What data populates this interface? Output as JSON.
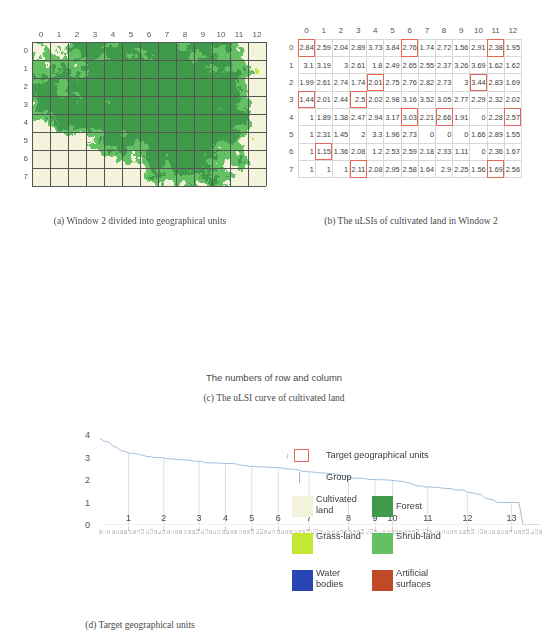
{
  "figure": {
    "panels": {
      "a": {
        "caption": "(a) Window 2 divided into geographical units"
      },
      "b": {
        "caption": "(b) The uLSIs of cultivated land in Window 2"
      },
      "c": {
        "caption": "(c) The uLSI curve of cultivated land"
      },
      "d": {
        "caption": "(d) Target geographical units"
      }
    }
  },
  "map": {
    "col_labels": [
      "0",
      "1",
      "2",
      "3",
      "4",
      "5",
      "6",
      "7",
      "8",
      "9",
      "10",
      "11",
      "12"
    ],
    "row_labels": [
      "0",
      "1",
      "2",
      "3",
      "4",
      "5",
      "6",
      "7"
    ]
  },
  "table": {
    "col_headers": [
      "0",
      "1",
      "2",
      "3",
      "4",
      "5",
      "6",
      "7",
      "8",
      "9",
      "10",
      "11",
      "12"
    ],
    "row_headers": [
      "0",
      "1",
      "2",
      "3",
      "4",
      "5",
      "6",
      "7"
    ],
    "rows": [
      [
        "2.84",
        "2.59",
        "2.04",
        "2.89",
        "3.73",
        "3.84",
        "2.76",
        "1.74",
        "2.72",
        "1.56",
        "2.91",
        "2.38",
        "1.95"
      ],
      [
        "3.1",
        "3.19",
        "3",
        "2.61",
        "1.8",
        "2.49",
        "2.65",
        "2.55",
        "2.37",
        "3.26",
        "3.69",
        "1.62",
        "1.62"
      ],
      [
        "1.99",
        "2.61",
        "2.74",
        "1.74",
        "2.01",
        "2.75",
        "2.76",
        "2.82",
        "2.73",
        "3",
        "3.44",
        "2.83",
        "1.69"
      ],
      [
        "1.44",
        "2.01",
        "2.44",
        "2.5",
        "2.02",
        "2.98",
        "3.16",
        "3.52",
        "3.05",
        "2.77",
        "2.29",
        "2.32",
        "2.02"
      ],
      [
        "1",
        "1.89",
        "1.38",
        "2.47",
        "2.94",
        "3.17",
        "3.03",
        "2.21",
        "2.66",
        "1.91",
        "0",
        "2.28",
        "2.57"
      ],
      [
        "1",
        "2.31",
        "1.45",
        "2",
        "3.3",
        "1.96",
        "2.73",
        "0",
        "0",
        "0",
        "1.66",
        "2.89",
        "1.55"
      ],
      [
        "1",
        "1.15",
        "1.36",
        "2.08",
        "1.2",
        "2.53",
        "2.59",
        "2.18",
        "2.33",
        "1.11",
        "0",
        "2.36",
        "1.67"
      ],
      [
        "1",
        "1",
        "1",
        "2.11",
        "2.08",
        "2.95",
        "2.58",
        "1.64",
        "2.9",
        "2.25",
        "1.56",
        "1.69",
        "2.56"
      ]
    ],
    "marked_cells": [
      [
        0,
        0
      ],
      [
        0,
        6
      ],
      [
        0,
        11
      ],
      [
        2,
        4
      ],
      [
        2,
        10
      ],
      [
        3,
        0
      ],
      [
        3,
        3
      ],
      [
        4,
        6
      ],
      [
        4,
        8
      ],
      [
        4,
        12
      ],
      [
        6,
        1
      ],
      [
        7,
        3
      ],
      [
        7,
        11
      ]
    ]
  },
  "chart_data": {
    "type": "line",
    "title": "",
    "xlabel": "The numbers of row and column",
    "ylabel": "uLSI",
    "ylim": [
      0,
      4
    ],
    "yticks": [
      0,
      1,
      2,
      3,
      4
    ],
    "grid": false,
    "legend": "none",
    "group_labels": [
      "1",
      "2",
      "3",
      "4",
      "5",
      "6",
      "7",
      "8",
      "9",
      "10",
      "11",
      "12",
      "13"
    ],
    "group_boundary_x": [
      0.065,
      0.145,
      0.225,
      0.285,
      0.345,
      0.405,
      0.475,
      0.565,
      0.625,
      0.665,
      0.745,
      0.835,
      0.935
    ],
    "series": [
      {
        "name": "uLSI sorted descending",
        "values": [
          3.84,
          3.73,
          3.69,
          3.52,
          3.44,
          3.3,
          3.26,
          3.19,
          3.17,
          3.16,
          3.1,
          3.05,
          3.03,
          3,
          3,
          2.98,
          2.95,
          2.94,
          2.91,
          2.9,
          2.89,
          2.89,
          2.84,
          2.83,
          2.82,
          2.77,
          2.76,
          2.76,
          2.75,
          2.74,
          2.73,
          2.73,
          2.72,
          2.66,
          2.65,
          2.61,
          2.61,
          2.59,
          2.59,
          2.58,
          2.57,
          2.56,
          2.55,
          2.53,
          2.5,
          2.49,
          2.47,
          2.44,
          2.38,
          2.37,
          2.36,
          2.33,
          2.32,
          2.31,
          2.29,
          2.28,
          2.25,
          2.21,
          2.18,
          2.11,
          2.08,
          2.08,
          2.08,
          2.04,
          2.02,
          2.02,
          2.01,
          2.01,
          2,
          1.99,
          1.96,
          1.95,
          1.91,
          1.89,
          1.8,
          1.74,
          1.74,
          1.69,
          1.69,
          1.67,
          1.66,
          1.64,
          1.62,
          1.62,
          1.56,
          1.56,
          1.55,
          1.45,
          1.44,
          1.38,
          1.36,
          1.2,
          1.15,
          1.11,
          1,
          1,
          1,
          1,
          1,
          1,
          0,
          0,
          0,
          0,
          0
        ]
      }
    ],
    "x_tick_labels_note": "row-column index pairs, rendered as micro-text"
  },
  "target_units": {
    "labels": [
      {
        "n": "9",
        "col": 0,
        "row": 0
      },
      {
        "n": "4",
        "col": 6,
        "row": 0
      },
      {
        "n": "7",
        "col": 11,
        "row": 0
      },
      {
        "n": "3",
        "col": 4,
        "row": 2
      },
      {
        "n": "1",
        "col": 10,
        "row": 2
      },
      {
        "n": "2",
        "col": 0,
        "row": 3
      },
      {
        "n": "10",
        "col": 3,
        "row": 3
      },
      {
        "n": "5",
        "col": 6,
        "row": 4
      },
      {
        "n": "12",
        "col": 8,
        "row": 4
      },
      {
        "n": "6",
        "col": 12,
        "row": 4
      },
      {
        "n": "13",
        "col": 1,
        "row": 6
      },
      {
        "n": "8",
        "col": 3,
        "row": 7
      },
      {
        "n": "11",
        "col": 11,
        "row": 7
      }
    ]
  },
  "legend": {
    "target_units": "Target geographical units",
    "group": "Group",
    "classes": [
      {
        "name": "Cultivated land",
        "color": "#f4f4dc"
      },
      {
        "name": "Forest",
        "color": "#3f9a4b"
      },
      {
        "name": "Grass-land",
        "color": "#c3e832"
      },
      {
        "name": "Shrub-land",
        "color": "#63c063"
      },
      {
        "name": "Water bodies",
        "color": "#2a45b5"
      },
      {
        "name": "Artificial surfaces",
        "color": "#c04a28"
      }
    ]
  },
  "colors": {
    "accent_red": "#e8655a",
    "curve": "#9ab8d8",
    "grid": "#555555"
  }
}
